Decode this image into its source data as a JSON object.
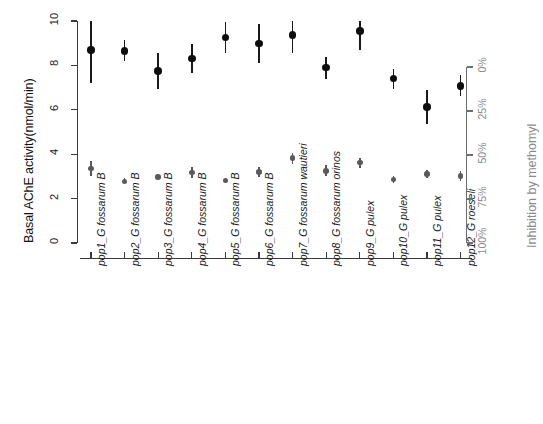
{
  "chart_data": {
    "type": "scatter",
    "title": "",
    "xlabel": "",
    "ylabel": "Basal AChE activity(nmol/min)",
    "ylabel_right": "Inhibition by methomyl",
    "ylim": [
      0,
      10
    ],
    "yticks": [
      0,
      2,
      4,
      6,
      8,
      10
    ],
    "ytick_labels": [
      "0",
      "2",
      "4",
      "6",
      "8",
      "10"
    ],
    "ylim_right": [
      0,
      100
    ],
    "yticks_right": [
      0,
      25,
      50,
      75,
      100
    ],
    "ytick_labels_right": [
      "0%",
      "25%",
      "50%",
      "75%",
      "100%"
    ],
    "right_axis_unit": "%",
    "grid": false,
    "legend": "none",
    "categories": [
      "pop1_G fossarum B",
      "pop2_G fossarum B",
      "pop3_G fossarum B",
      "pop4_G fossarum B",
      "pop5_G fossarum B",
      "pop6_G fossarum B",
      "pop7_G fossarum wautieri",
      "pop8_G fossarum orinos",
      "pop9_G pulex",
      "pop10_G pulex",
      "pop11_G pulex",
      "pop12_G roeseli"
    ],
    "series": [
      {
        "name": "Basal AChE activity",
        "color": "#0d0d0d",
        "axis": "left",
        "marker": "filled-circle",
        "marker_size": 7.5,
        "values": [
          8.7,
          8.65,
          7.75,
          8.3,
          9.25,
          8.98,
          9.38,
          7.9,
          9.55,
          7.4,
          6.12,
          7.08
        ],
        "err_low": [
          7.2,
          8.2,
          6.95,
          7.65,
          8.55,
          8.1,
          8.55,
          7.4,
          8.7,
          6.95,
          5.35,
          6.6
        ],
        "err_high": [
          10.0,
          9.15,
          8.55,
          8.95,
          9.95,
          9.85,
          10.0,
          8.4,
          10.0,
          7.85,
          6.9,
          7.55
        ]
      },
      {
        "name": "Inhibition by methomyl (residual activity)",
        "color": "#5a5a5a",
        "axis": "left",
        "marker": "filled-circle",
        "marker_size": 5.5,
        "values": [
          3.35,
          2.78,
          2.98,
          3.18,
          2.82,
          3.2,
          3.82,
          3.25,
          3.62,
          2.85,
          3.1,
          3.02
        ],
        "err_low": [
          3.0,
          2.68,
          2.88,
          2.92,
          2.72,
          2.98,
          3.58,
          3.0,
          3.38,
          2.72,
          2.92,
          2.8
        ],
        "err_high": [
          3.68,
          2.92,
          3.1,
          3.42,
          2.95,
          3.42,
          4.05,
          3.52,
          3.85,
          3.0,
          3.28,
          3.25
        ]
      }
    ]
  },
  "axes": {
    "left_title": "Basal AChE activity(nmol/min)",
    "right_title": "Inhibition by methomyl"
  }
}
